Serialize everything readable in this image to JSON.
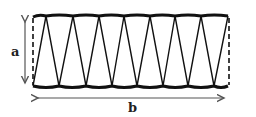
{
  "diagram": {
    "type": "zigzag-truss-panel",
    "labels": {
      "height": "a",
      "width": "b"
    },
    "colors": {
      "stroke": "#111111",
      "arrow": "#555555",
      "background": "#ffffff"
    },
    "top_y": 16,
    "bottom_y": 87,
    "top_vertices_x": [
      33,
      46,
      73,
      99,
      124,
      150,
      175,
      201,
      228
    ],
    "bottom_vertices_x": [
      33,
      59,
      86,
      112,
      137,
      163,
      188,
      214,
      228
    ],
    "dimension_a": {
      "x": 25,
      "y1": 17,
      "y2": 88
    },
    "dimension_b": {
      "y": 98,
      "x1": 33,
      "x2": 228
    }
  }
}
